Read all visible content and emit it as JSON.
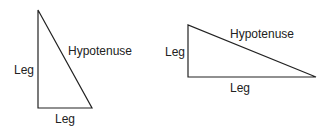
{
  "diagram": {
    "triangles": [
      {
        "id": "tall",
        "vertices": [
          [
            38,
            10
          ],
          [
            38,
            108
          ],
          [
            92,
            108
          ]
        ],
        "labels": {
          "hypotenuse": "Hypotenuse",
          "vertical_leg": "Leg",
          "horizontal_leg": "Leg"
        }
      },
      {
        "id": "wide",
        "vertices": [
          [
            188,
            25
          ],
          [
            188,
            77
          ],
          [
            316,
            77
          ]
        ],
        "labels": {
          "hypotenuse": "Hypotenuse",
          "vertical_leg": "Leg",
          "horizontal_leg": "Leg"
        }
      }
    ],
    "line_color": "#222222"
  }
}
